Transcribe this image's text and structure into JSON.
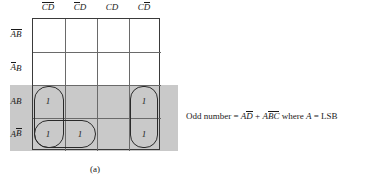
{
  "figure": {
    "caption": "(a)"
  },
  "kmap": {
    "column_headers": [
      {
        "id": "col-0",
        "label": "CD",
        "bars": "both",
        "text": "C̄D̄"
      },
      {
        "id": "col-1",
        "label": "CD",
        "bars": "first",
        "text": "C̄D"
      },
      {
        "id": "col-2",
        "label": "CD",
        "bars": "none",
        "text": "CD"
      },
      {
        "id": "col-3",
        "label": "CD",
        "bars": "second",
        "text": "CD̄"
      }
    ],
    "row_headers": [
      {
        "id": "row-0",
        "label": "AB",
        "bars": "both",
        "text": "ĀB̄"
      },
      {
        "id": "row-1",
        "label": "AB",
        "bars": "first",
        "text": "ĀB"
      },
      {
        "id": "row-2",
        "label": "AB",
        "bars": "none",
        "text": "AB"
      },
      {
        "id": "row-3",
        "label": "AB",
        "bars": "second",
        "text": "AB̄"
      }
    ],
    "cells": [
      {
        "id": "cell-r0c0",
        "row": 0,
        "col": 0,
        "value": ""
      },
      {
        "id": "cell-r0c1",
        "row": 0,
        "col": 1,
        "value": ""
      },
      {
        "id": "cell-r0c2",
        "row": 0,
        "col": 2,
        "value": ""
      },
      {
        "id": "cell-r0c3",
        "row": 0,
        "col": 3,
        "value": ""
      },
      {
        "id": "cell-r1c0",
        "row": 1,
        "col": 0,
        "value": ""
      },
      {
        "id": "cell-r1c1",
        "row": 1,
        "col": 1,
        "value": ""
      },
      {
        "id": "cell-r1c2",
        "row": 1,
        "col": 2,
        "value": ""
      },
      {
        "id": "cell-r1c3",
        "row": 1,
        "col": 3,
        "value": ""
      },
      {
        "id": "cell-r2c0",
        "row": 2,
        "col": 0,
        "value": "1"
      },
      {
        "id": "cell-r2c1",
        "row": 2,
        "col": 1,
        "value": ""
      },
      {
        "id": "cell-r2c2",
        "row": 2,
        "col": 2,
        "value": ""
      },
      {
        "id": "cell-r2c3",
        "row": 2,
        "col": 3,
        "value": "1"
      },
      {
        "id": "cell-r3c0",
        "row": 3,
        "col": 0,
        "value": "1"
      },
      {
        "id": "cell-r3c1",
        "row": 3,
        "col": 1,
        "value": "1"
      },
      {
        "id": "cell-r3c2",
        "row": 3,
        "col": 2,
        "value": ""
      },
      {
        "id": "cell-r3c3",
        "row": 3,
        "col": 3,
        "value": "1"
      }
    ],
    "groups": [
      {
        "id": "group-0",
        "name": "vertical-pair-left",
        "cells": [
          "cell-r2c0",
          "cell-r3c0"
        ]
      },
      {
        "id": "group-1",
        "name": "horizontal-pair-bottom",
        "cells": [
          "cell-r3c0",
          "cell-r3c1"
        ]
      },
      {
        "id": "group-2",
        "name": "vertical-pair-right",
        "cells": [
          "cell-r2c3",
          "cell-r3c3"
        ]
      }
    ],
    "shading": {
      "row_band_label": "A = 1 rows (AB, AB̄)",
      "col_band_label": "D̄ column (CD̄)",
      "color": "#c9c9c9"
    }
  },
  "equation": {
    "lhs": "Odd number",
    "equals": "=",
    "term1_var": "A",
    "term1_bar": "D",
    "plus": "+",
    "term2_var": "A",
    "term2_bar": "BC",
    "condition_prefix": "where",
    "condition_var": "A",
    "condition_equals": "=",
    "condition_value": "LSB",
    "full_text": "Odd number = AD̄ + AB̄C̄ where A = LSB"
  }
}
